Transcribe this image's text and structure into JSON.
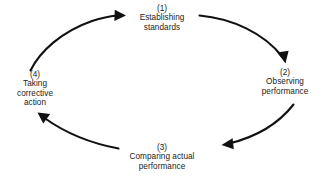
{
  "diagram": {
    "direction": "clockwise",
    "line_color": "#111111",
    "background_color": "#ffffff",
    "nodes": [
      {
        "id": "establishing-standards",
        "number": "(1)",
        "lines": [
          "Establishing",
          "standards"
        ],
        "position": "top"
      },
      {
        "id": "observing-performance",
        "number": "(2)",
        "lines": [
          "Observing",
          "performance"
        ],
        "position": "right"
      },
      {
        "id": "comparing-actual-performance",
        "number": "(3)",
        "lines": [
          "Comparing actual",
          "performance"
        ],
        "position": "bottom"
      },
      {
        "id": "taking-corrective-action",
        "number": "(4)",
        "lines": [
          "Taking",
          "corrective",
          "action"
        ],
        "position": "left"
      }
    ],
    "arrows": [
      {
        "id": "arrow-1-to-2",
        "from": "(1)",
        "to": "(2)"
      },
      {
        "id": "arrow-2-to-3",
        "from": "(2)",
        "to": "(3)"
      },
      {
        "id": "arrow-3-to-4",
        "from": "(3)",
        "to": "(4)"
      },
      {
        "id": "arrow-4-to-1",
        "from": "(4)",
        "to": "(1)"
      }
    ]
  }
}
